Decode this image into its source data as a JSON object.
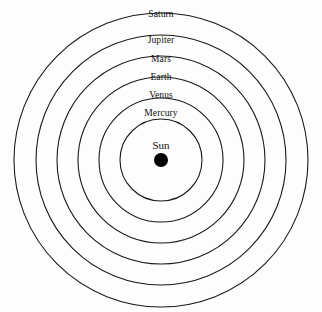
{
  "diagram": {
    "background_color": "#fdfdfd",
    "line_color": "#1a1a1a",
    "text_color": "#111111",
    "center": {
      "x": 161,
      "y": 160
    },
    "center_body": {
      "label": "Sun",
      "label_x": 161,
      "label_y": 139,
      "dot_radius": 7,
      "dot_color": "#000000"
    },
    "orbits": [
      {
        "label": "Mercury",
        "radius": 41,
        "label_x": 161,
        "label_y": 108,
        "stroke_width": 1.1
      },
      {
        "label": "Venus",
        "radius": 62,
        "label_x": 161,
        "label_y": 90,
        "stroke_width": 1.1
      },
      {
        "label": "Earth",
        "radius": 83,
        "label_x": 161,
        "label_y": 72,
        "stroke_width": 1.1
      },
      {
        "label": "Mars",
        "radius": 104,
        "label_x": 161,
        "label_y": 54,
        "stroke_width": 1.1
      },
      {
        "label": "Jupiter",
        "radius": 125,
        "label_x": 161,
        "label_y": 35,
        "stroke_width": 1.1
      },
      {
        "label": "Saturn",
        "radius": 147,
        "label_x": 161,
        "label_y": 9,
        "stroke_width": 1.1
      }
    ]
  }
}
